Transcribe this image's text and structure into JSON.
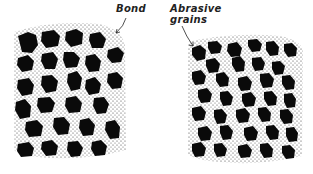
{
  "labels": {
    "bond": "Bond",
    "abrasive_line1": "Abrasive",
    "abrasive_line2": "grains"
  },
  "panels": [
    {
      "name": "open-structure",
      "description": "Widely spaced abrasive grains in bond"
    },
    {
      "name": "dense-structure",
      "description": "Closely spaced abrasive grains in bond"
    }
  ],
  "colors": {
    "grain": "#0a0a0a",
    "bond_stipple": "#333333",
    "background": "#ffffff"
  }
}
